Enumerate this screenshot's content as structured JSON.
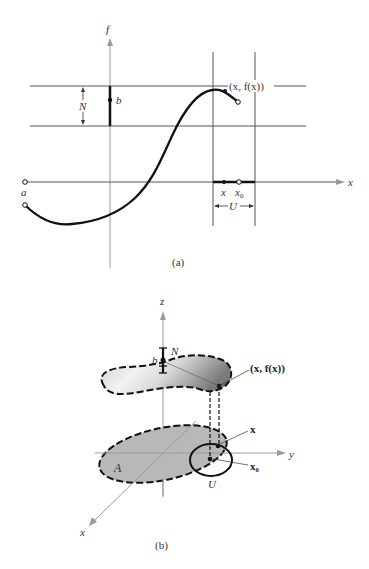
{
  "figure_a": {
    "caption": "(a)",
    "labels": {
      "f_axis": "f",
      "x_axis": "x",
      "a": "a",
      "b": "b",
      "N": "N",
      "point": "(x, f(x))",
      "x": "x",
      "x0_base": "x",
      "x0_sub": "0",
      "U": "U"
    }
  },
  "figure_b": {
    "caption": "(b)",
    "labels": {
      "z_axis": "z",
      "y_axis": "y",
      "x_axis": "x",
      "N": "N",
      "b": "b",
      "point": "(x, f(x))",
      "x": "x",
      "x0": "x₀",
      "A": "A",
      "U": "U"
    }
  },
  "colors": {
    "axis": "#999999",
    "line": "#555555",
    "curve": "#111111",
    "region_fill": "#b8b8b8"
  }
}
